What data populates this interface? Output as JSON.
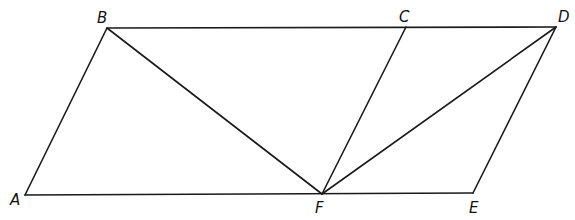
{
  "diagram": {
    "points": {
      "A": {
        "label": "A",
        "x": 25,
        "y": 195,
        "lx": 10,
        "ly": 205
      },
      "B": {
        "label": "B",
        "x": 107,
        "y": 28,
        "lx": 97,
        "ly": 23
      },
      "C": {
        "label": "C",
        "x": 406,
        "y": 27,
        "lx": 399,
        "ly": 22
      },
      "D": {
        "label": "D",
        "x": 556,
        "y": 27,
        "lx": 558,
        "ly": 22
      },
      "E": {
        "label": "E",
        "x": 473,
        "y": 193,
        "lx": 469,
        "ly": 213
      },
      "F": {
        "label": "F",
        "x": 322,
        "y": 194,
        "lx": 315,
        "ly": 213
      }
    },
    "segments": [
      {
        "name": "segment-ab",
        "from": "A",
        "to": "B"
      },
      {
        "name": "segment-bd",
        "from": "B",
        "to": "D"
      },
      {
        "name": "segment-de",
        "from": "D",
        "to": "E"
      },
      {
        "name": "segment-ae",
        "from": "A",
        "to": "E"
      },
      {
        "name": "segment-bf",
        "from": "B",
        "to": "F"
      },
      {
        "name": "segment-cf",
        "from": "C",
        "to": "F"
      },
      {
        "name": "segment-df",
        "from": "D",
        "to": "F"
      }
    ],
    "line_color": "#1a1a1a"
  }
}
